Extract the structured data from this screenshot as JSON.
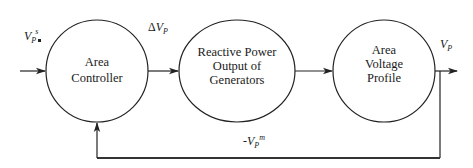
{
  "diagram": {
    "type": "feedback-control-block-diagram",
    "nodes": [
      {
        "id": "area-controller",
        "lines": [
          "Area",
          "Controller"
        ]
      },
      {
        "id": "reactive-power",
        "lines": [
          "Reactive Power",
          "Output of",
          "Generators"
        ]
      },
      {
        "id": "area-voltage-profile",
        "lines": [
          "Area",
          "Voltage",
          "Profile"
        ]
      }
    ],
    "signals": {
      "input": {
        "main": "V",
        "sub": "P",
        "sup": "s"
      },
      "delta": {
        "prefix": "Δ",
        "main": "V",
        "sub": "P"
      },
      "output": {
        "main": "V",
        "sub": "P"
      },
      "feedback": {
        "prefix": "-",
        "main": "V",
        "sub": "P",
        "sup": "m"
      }
    },
    "edges": [
      {
        "from": "input",
        "to": "area-controller",
        "label": "V_P^s"
      },
      {
        "from": "area-controller",
        "to": "reactive-power",
        "label": "ΔV_P"
      },
      {
        "from": "reactive-power",
        "to": "area-voltage-profile",
        "label": ""
      },
      {
        "from": "area-voltage-profile",
        "to": "output",
        "label": "V_P"
      },
      {
        "from": "area-voltage-profile",
        "to": "area-controller",
        "label": "-V_P^m",
        "kind": "feedback"
      }
    ],
    "colors": {
      "line": "#222222",
      "text": "#1a1a1a",
      "background": "#ffffff"
    }
  }
}
